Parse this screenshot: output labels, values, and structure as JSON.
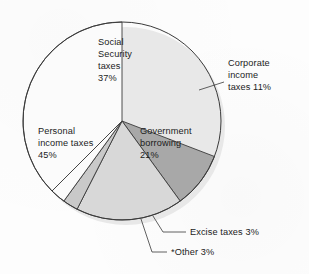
{
  "figure": {
    "type": "pie-chart",
    "background_color": "#fdfdfd",
    "outline_color": "#3a3a3a"
  },
  "chart_data": {
    "type": "pie",
    "title": "",
    "subtitle": "",
    "xlabel": "",
    "ylabel": "",
    "grid": false,
    "legend_position": "none",
    "units": "percent",
    "start_angle_deg": 0,
    "direction": "clockwise",
    "total": 100,
    "categories": [
      "Social Security taxes",
      "Corporate income taxes",
      "Government borrowing",
      "Excise taxes",
      "*Other",
      "Personal income taxes"
    ],
    "values": [
      37,
      11,
      21,
      3,
      3,
      45
    ],
    "colors": [
      "#c3c3c3",
      "#a8a8a8",
      "#d8d8d8",
      "#c9c9c9",
      "#fbfbfb",
      "#fbfbfb"
    ],
    "slices": [
      {
        "name": "social-security-taxes",
        "label_lines": [
          "Social",
          "Security",
          "taxes",
          "37%"
        ],
        "label_text": "Social Security taxes 37%",
        "value": 37,
        "value_text": "37%",
        "color": "#c3c3c3",
        "label_placement": "inside"
      },
      {
        "name": "corporate-income-taxes",
        "label_lines": [
          "Corporate",
          "income",
          "taxes 11%"
        ],
        "label_text": "Corporate income taxes 11%",
        "value": 11,
        "value_text": "11%",
        "color": "#a8a8a8",
        "label_placement": "outside-right"
      },
      {
        "name": "government-borrowing",
        "label_lines": [
          "Government",
          "borrowing",
          "21%"
        ],
        "label_text": "Government borrowing 21%",
        "value": 21,
        "value_text": "21%",
        "color": "#d8d8d8",
        "label_placement": "inside"
      },
      {
        "name": "excise-taxes",
        "label_lines": [
          "Excise taxes 3%"
        ],
        "label_text": "Excise taxes 3%",
        "value": 3,
        "value_text": "3%",
        "color": "#c9c9c9",
        "label_placement": "outside-bottom"
      },
      {
        "name": "other",
        "label_lines": [
          "*Other 3%"
        ],
        "label_text": "*Other 3%",
        "value": 3,
        "value_text": "3%",
        "color": "#fbfbfb",
        "label_placement": "outside-bottom"
      },
      {
        "name": "personal-income-taxes",
        "label_lines": [
          "Personal",
          "income taxes",
          "45%"
        ],
        "label_text": "Personal income taxes 45%",
        "value": 45,
        "value_text": "45%",
        "color": "#fbfbfb",
        "label_placement": "inside"
      }
    ]
  },
  "labels": {
    "social_security": {
      "l1": "Social",
      "l2": "Security",
      "l3": "taxes",
      "l4": "37%"
    },
    "corporate": {
      "l1": "Corporate",
      "l2": "income",
      "l3": "taxes 11%"
    },
    "government_borrowing": {
      "l1": "Government",
      "l2": "borrowing",
      "l3": "21%"
    },
    "personal_income": {
      "l1": "Personal",
      "l2": "income taxes",
      "l3": "45%"
    },
    "excise": {
      "l1": "Excise taxes 3%"
    },
    "other": {
      "l1": "*Other 3%"
    }
  }
}
